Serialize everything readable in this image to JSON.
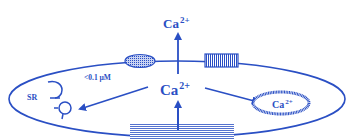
{
  "diagram": {
    "colors": {
      "stroke": "#2a4fc4",
      "background": "#ffffff"
    },
    "labels": {
      "ca_top": {
        "base": "Ca",
        "sup": "2+"
      },
      "ca_center": {
        "base": "Ca",
        "sup": "2+"
      },
      "ca_organelle": {
        "base": "Ca",
        "sup": "2+"
      },
      "concentration": "<0.1 µM",
      "sr": "SR"
    },
    "elements": [
      "cell-membrane",
      "plasma-membrane-pump",
      "plasma-membrane-exchanger",
      "sarcoplasmic-reticulum",
      "mitochondrion",
      "ca-influx-channel"
    ]
  }
}
